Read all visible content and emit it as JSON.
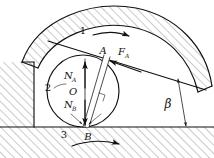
{
  "figure": {
    "background_color": "#ffffff",
    "line_color": "#111111",
    "hatch_color": "#555555"
  },
  "labels": {
    "link1": "1",
    "link2": "2",
    "link3": "3",
    "point_a": "A",
    "point_b": "B",
    "center_o": "O",
    "force_fa_base": "F",
    "force_fa_sub": "A",
    "force_na_base": "N",
    "force_na_sub": "A",
    "force_nb_base": "N",
    "force_nb_sub": "B",
    "angle_beta": "β"
  },
  "elements": {
    "cam_band": "curved-hatched-cam-link-1",
    "roller": "circle-roller-link-2",
    "ground": "hatched-ground-frame-link-3",
    "wall": "hatched-left-wall",
    "contact_tangent_line": "tangent-line-through-A",
    "connecting_bar": "narrow-bar-from-A-to-B",
    "right_angle_marker": "perpendicular-square-marker",
    "motion_arrow_link1": "arrow-right-cam-motion",
    "motion_arrow_link3": "curved-arrow-right-ground-motion",
    "beta_dimension": "vertical-dimension-line-for-beta"
  }
}
